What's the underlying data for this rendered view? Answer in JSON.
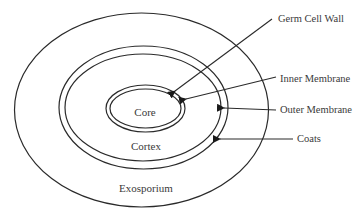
{
  "diagram": {
    "regions": {
      "core": "Core",
      "cortex": "Cortex",
      "exosporium": "Exosporium"
    },
    "callouts": [
      {
        "label": "Germ Cell Wall"
      },
      {
        "label": "Inner Membrane"
      },
      {
        "label": "Outer Membrane"
      },
      {
        "label": "Coats"
      }
    ],
    "colors": {
      "stroke": "#2a2a2a",
      "text": "#3a3a3a",
      "background": "#ffffff"
    }
  }
}
